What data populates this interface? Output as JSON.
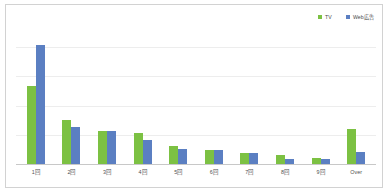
{
  "chart_data": {
    "type": "bar",
    "title": "",
    "subtitle": "",
    "xlabel": "",
    "ylabel": "",
    "grid": true,
    "legend_position": "top-right",
    "ylim": [
      0,
      100
    ],
    "categories": [
      "1回",
      "2回",
      "3回",
      "4回",
      "5回",
      "6回",
      "7回",
      "8回",
      "9回",
      "Over"
    ],
    "series": [
      {
        "name": "TV",
        "color": "#7cc143",
        "values": [
          54,
          31,
          23,
          22,
          13,
          10,
          8,
          7,
          5,
          25
        ]
      },
      {
        "name": "Web広告",
        "color": "#5b7fc2",
        "values": [
          82,
          26,
          23,
          17,
          11,
          10,
          8,
          4,
          4,
          9
        ]
      }
    ]
  },
  "legend": {
    "items": [
      {
        "label": "TV",
        "color": "#7cc143"
      },
      {
        "label": "Web広告",
        "color": "#5b7fc2"
      }
    ]
  },
  "colors": {
    "tv": "#7cc143",
    "web": "#5b7fc2",
    "frame_border": "#d2d2d2",
    "gridline": "#ededed",
    "axis": "#c8c8c8",
    "label_text": "#4f4f4f"
  }
}
